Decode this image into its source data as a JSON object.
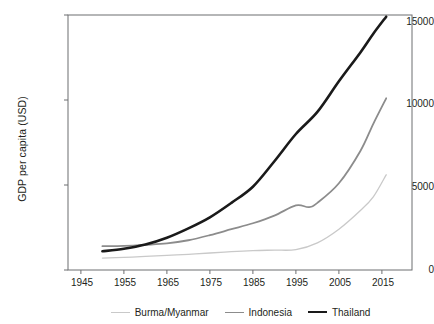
{
  "chart_data": {
    "type": "line",
    "title": "",
    "subtitle": "",
    "xlabel": "",
    "ylabel": "GDP per capita (USD)",
    "xlim": [
      1942,
      2022
    ],
    "ylim": [
      0,
      15000
    ],
    "xticks": [
      1945,
      1955,
      1965,
      1975,
      1985,
      1995,
      2005,
      2015
    ],
    "yticks": [
      0,
      5000,
      10000,
      15000
    ],
    "grid": false,
    "legend_position": "below-axes",
    "frame": "box",
    "series": [
      {
        "name": "Burma/Myanmar",
        "color": "#c9c9c9",
        "width": 1.3,
        "x": [
          1950,
          1955,
          1960,
          1965,
          1970,
          1975,
          1980,
          1985,
          1990,
          1995,
          2000,
          2005,
          2010,
          2013,
          2016
        ],
        "values": [
          700,
          740,
          800,
          860,
          920,
          1000,
          1080,
          1140,
          1170,
          1200,
          1600,
          2400,
          3500,
          4300,
          5600
        ]
      },
      {
        "name": "Indonesia",
        "color": "#8c8c8c",
        "width": 1.8,
        "x": [
          1950,
          1955,
          1960,
          1965,
          1970,
          1975,
          1980,
          1985,
          1990,
          1995,
          1998,
          2000,
          2005,
          2010,
          2013,
          2016
        ],
        "values": [
          1400,
          1420,
          1480,
          1560,
          1750,
          2050,
          2400,
          2750,
          3200,
          3800,
          3700,
          3950,
          5100,
          7000,
          8600,
          10100
        ]
      },
      {
        "name": "Thailand",
        "color": "#1a1a1a",
        "width": 2.6,
        "x": [
          1950,
          1955,
          1960,
          1965,
          1970,
          1975,
          1980,
          1985,
          1990,
          1995,
          2000,
          2005,
          2010,
          2013,
          2016
        ],
        "values": [
          1100,
          1250,
          1500,
          1900,
          2450,
          3100,
          3950,
          4900,
          6400,
          8000,
          9300,
          11100,
          12800,
          13900,
          14900
        ]
      }
    ]
  },
  "axes": {
    "ylabel": "GDP per capita (USD)",
    "ytick_labels": [
      "0",
      "5000",
      "10000",
      "15000"
    ],
    "xtick_labels": [
      "1945",
      "1955",
      "1965",
      "1975",
      "1985",
      "1995",
      "2005",
      "2015"
    ]
  },
  "legend": {
    "entries": [
      {
        "label": "Burma/Myanmar",
        "color": "#c9c9c9"
      },
      {
        "label": "Indonesia",
        "color": "#8c8c8c"
      },
      {
        "label": "Thailand",
        "color": "#1a1a1a"
      }
    ]
  },
  "colors": {
    "axis": "#6d6e71",
    "text": "#231f20",
    "background": "#ffffff"
  }
}
